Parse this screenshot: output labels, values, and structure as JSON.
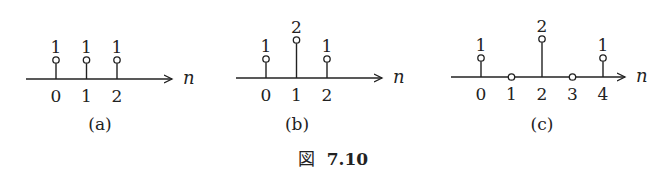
{
  "figure_caption": {
    "prefix": "図",
    "number": "7.10"
  },
  "axis_variable": "n",
  "chart_data": [
    {
      "type": "stem",
      "caption": "(a)",
      "xlabel": "n",
      "x": [
        0,
        1,
        2
      ],
      "values": [
        1,
        1,
        1
      ],
      "tick_labels": [
        "0",
        "1",
        "2"
      ],
      "value_labels": [
        "1",
        "1",
        "1"
      ]
    },
    {
      "type": "stem",
      "caption": "(b)",
      "xlabel": "n",
      "x": [
        0,
        1,
        2
      ],
      "values": [
        1,
        2,
        1
      ],
      "tick_labels": [
        "0",
        "1",
        "2"
      ],
      "value_labels": [
        "1",
        "2",
        "1"
      ]
    },
    {
      "type": "stem",
      "caption": "(c)",
      "xlabel": "n",
      "x": [
        0,
        1,
        2,
        3,
        4
      ],
      "values": [
        1,
        0,
        2,
        0,
        1
      ],
      "tick_labels": [
        "0",
        "1",
        "2",
        "3",
        "4"
      ],
      "value_labels": [
        "1",
        "",
        "2",
        "",
        "1"
      ]
    }
  ]
}
